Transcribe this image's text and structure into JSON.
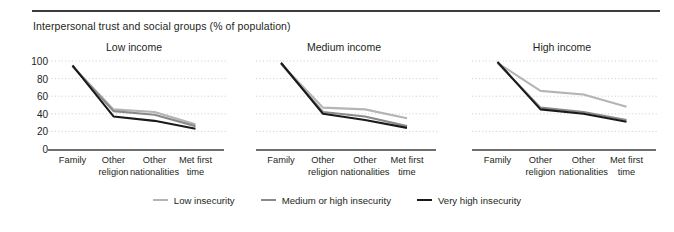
{
  "figure": {
    "title": "Interpersonal trust and social groups (% of population)",
    "rule_color": "#3b3b3b"
  },
  "legend": {
    "items": [
      {
        "label": "Low insecurity",
        "color": "#b4b4b4",
        "swatch_name": "legend-swatch-low-insecurity"
      },
      {
        "label": "Medium or high insecurity",
        "color": "#8a8a8a",
        "swatch_name": "legend-swatch-medium-or-high-insecurity"
      },
      {
        "label": "Very high insecurity",
        "color": "#1a1a1a",
        "swatch_name": "legend-swatch-very-high-insecurity"
      }
    ]
  },
  "axis": {
    "yticks": [
      "100",
      "80",
      "60",
      "40",
      "20",
      "0"
    ],
    "ymin": 0,
    "ymax": 100,
    "categories": [
      [
        "Family",
        ""
      ],
      [
        "Other",
        "religion"
      ],
      [
        "Other",
        "nationalities"
      ],
      [
        "Met first",
        "time"
      ]
    ]
  },
  "panels": [
    {
      "title": "Low income"
    },
    {
      "title": "Medium income"
    },
    {
      "title": "High income"
    }
  ],
  "chart_data": {
    "type": "line",
    "title": "Interpersonal trust and social groups (% of population)",
    "xlabel": "",
    "ylabel": "% of population",
    "ylim": [
      0,
      100
    ],
    "yticks": [
      0,
      20,
      40,
      60,
      80,
      100
    ],
    "grid": "horizontal-dotted",
    "legend_position": "bottom-center",
    "categories": [
      "Family",
      "Other religion",
      "Other nationalities",
      "Met first time"
    ],
    "panels": [
      {
        "name": "Low income",
        "series": [
          {
            "name": "Low insecurity",
            "color": "#b4b4b4",
            "values": [
              94,
              45,
              42,
              28
            ]
          },
          {
            "name": "Medium or high insecurity",
            "color": "#8a8a8a",
            "values": [
              94,
              43,
              39,
              26
            ]
          },
          {
            "name": "Very high insecurity",
            "color": "#1a1a1a",
            "values": [
              95,
              37,
              32,
              23
            ]
          }
        ]
      },
      {
        "name": "Medium income",
        "series": [
          {
            "name": "Low insecurity",
            "color": "#b4b4b4",
            "values": [
              97,
              47,
              45,
              35
            ]
          },
          {
            "name": "Medium or high insecurity",
            "color": "#8a8a8a",
            "values": [
              97,
              42,
              37,
              26
            ]
          },
          {
            "name": "Very high insecurity",
            "color": "#1a1a1a",
            "values": [
              98,
              40,
              33,
              24
            ]
          }
        ]
      },
      {
        "name": "High income",
        "series": [
          {
            "name": "Low insecurity",
            "color": "#b4b4b4",
            "values": [
              98,
              66,
              62,
              48
            ]
          },
          {
            "name": "Medium or high insecurity",
            "color": "#8a8a8a",
            "values": [
              98,
              47,
              42,
              33
            ]
          },
          {
            "name": "Very high insecurity",
            "color": "#1a1a1a",
            "values": [
              99,
              45,
              40,
              31
            ]
          }
        ]
      }
    ]
  }
}
